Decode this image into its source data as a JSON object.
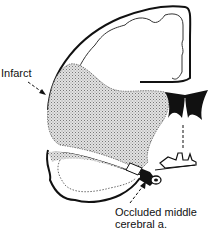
{
  "diagram": {
    "type": "coronal brain section, middle cerebral artery infarct",
    "labels": {
      "infarct": "Infarct",
      "occluded_line1": "Occluded middle",
      "occluded_line2": "cerebral a."
    },
    "colors": {
      "outline": "#111111",
      "infarct_fill": "#c8c8c8",
      "background": "#ffffff"
    }
  }
}
